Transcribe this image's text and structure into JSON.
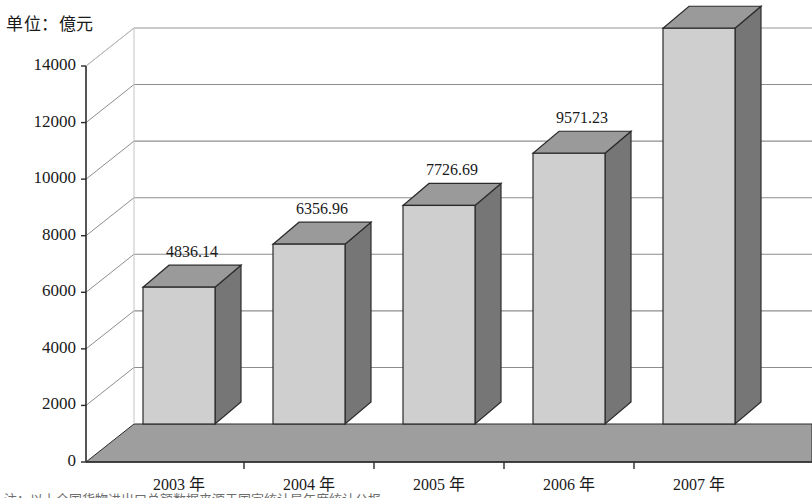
{
  "chart_data": {
    "type": "bar",
    "title": "",
    "subtitle": "",
    "unit_label": "单位：億元",
    "xlabel": "",
    "ylabel": "",
    "categories": [
      "2003 年",
      "2004 年",
      "2005 年",
      "2006 年",
      "2007 年"
    ],
    "values": [
      4836.14,
      6356.96,
      7726.69,
      9571.23,
      13991.18
    ],
    "value_labels": [
      "4836.14",
      "6356.96",
      "7726.69",
      "9571.23",
      "13991.18"
    ],
    "ylim": [
      0,
      14000
    ],
    "yticks": [
      0,
      2000,
      4000,
      6000,
      8000,
      10000,
      12000,
      14000
    ],
    "ytick_labels": [
      "0",
      "2000",
      "4000",
      "6000",
      "8000",
      "10000",
      "12000",
      "14000"
    ],
    "grid": true,
    "legend": "none",
    "three_d": true,
    "colors": {
      "bar_front": "#cfcfcf",
      "bar_side": "#767676",
      "bar_top": "#9a9a9a",
      "bar_outline": "#2b2b2b",
      "floor": "#9e9e9e",
      "floor_front": "#8a8a8a",
      "wall": "#ffffff",
      "gridline": "#8d8d8d",
      "axis": "#2b2b2b",
      "text": "#1a1a1a"
    }
  },
  "footnote": {
    "text": "注：以上全国货物进出口总额数据来源于国家统计局年度统计公报"
  }
}
